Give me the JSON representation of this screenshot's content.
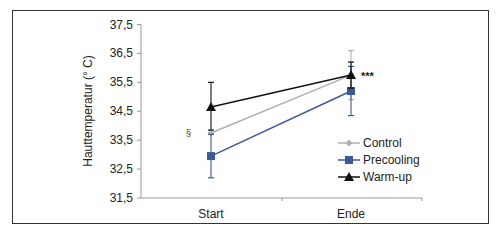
{
  "chart_data": {
    "type": "line",
    "title": "",
    "xlabel": "",
    "ylabel": "Hauttemperatur (° C)",
    "ylim": [
      31.5,
      37.5
    ],
    "yticks": [
      "31,5",
      "32,5",
      "33,5",
      "34,5",
      "35,5",
      "36,5",
      "37,5"
    ],
    "categories": [
      "Start",
      "Ende"
    ],
    "series": [
      {
        "name": "Control",
        "color": "#b0b0b0",
        "marker": "diamond",
        "values": [
          33.75,
          35.75
        ],
        "error": [
          0.0,
          0.85
        ]
      },
      {
        "name": "Precooling",
        "color": "#3a5a9a",
        "marker": "square",
        "values": [
          32.95,
          35.2
        ],
        "error": [
          0.75,
          0.85
        ]
      },
      {
        "name": "Warm-up",
        "color": "#111111",
        "marker": "triangle",
        "values": [
          34.65,
          35.75
        ],
        "error": [
          0.85,
          0.45
        ]
      }
    ],
    "annotations": [
      {
        "text": "§",
        "near": "Start"
      },
      {
        "text": "***",
        "near": "Ende"
      }
    ],
    "legend_position": "right",
    "grid": false
  },
  "labels": {
    "ylabel": "Hauttemperatur (° C)",
    "section": "§",
    "stars": "***"
  }
}
